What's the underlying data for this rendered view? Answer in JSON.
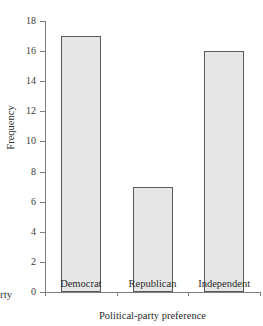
{
  "chart_data": {
    "type": "bar",
    "title": "",
    "xlabel": "Political-party preference",
    "ylabel": "Frequency",
    "categories": [
      "Democrat",
      "Republican",
      "Independent"
    ],
    "values": [
      17,
      7,
      16
    ],
    "ylim": [
      0,
      18
    ],
    "ytick_labels": [
      "0",
      "2",
      "4",
      "6",
      "8",
      "10",
      "12",
      "14",
      "16",
      "18"
    ],
    "ytick_values": [
      0,
      2,
      4,
      6,
      8,
      10,
      12,
      14,
      16,
      18
    ],
    "grid": false,
    "legend": null,
    "bar_fill_color": "#e6e6e6",
    "bar_edge_color": "#5a5a5a",
    "axis_color": "#7d7d7d"
  },
  "edge_text": {
    "clipped_fragment": "rty"
  }
}
